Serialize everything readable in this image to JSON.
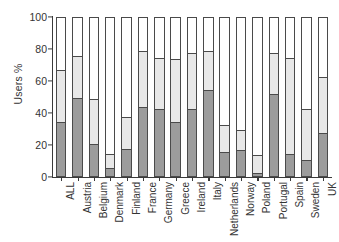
{
  "chart_data": {
    "type": "bar",
    "subtype": "stacked-bar",
    "title": "",
    "xlabel": "",
    "ylabel": "Users %",
    "ylim": [
      0,
      100
    ],
    "yticks": [
      0,
      20,
      40,
      60,
      80,
      100
    ],
    "ytick_labels": [
      "0",
      "20",
      "40",
      "60",
      "80",
      "100"
    ],
    "grid": false,
    "legend": "none",
    "stacked_total": 100,
    "categories": [
      "ALL",
      "Austria",
      "Belgium",
      "Denmark",
      "Finland",
      "France",
      "Germany",
      "Greece",
      "Ireland",
      "Italy",
      "Netherlands",
      "Norway",
      "Poland",
      "Portugal",
      "Spain",
      "Sweden",
      "UK"
    ],
    "series": [
      {
        "name": "dark-gray-segment",
        "color": "#9c9c9c",
        "values": [
          34,
          49,
          20,
          5,
          17,
          43,
          42,
          34,
          42,
          54,
          15,
          16,
          2,
          51,
          14,
          10,
          27
        ]
      },
      {
        "name": "light-gray-segment",
        "color": "#e8e8e8",
        "values": [
          32,
          26,
          28,
          9,
          20,
          35,
          32,
          39,
          35,
          24,
          17,
          13,
          11,
          26,
          60,
          32,
          35
        ]
      },
      {
        "name": "white-segment",
        "color": "#ffffff",
        "values": [
          34,
          25,
          52,
          86,
          63,
          22,
          26,
          27,
          23,
          22,
          68,
          71,
          87,
          23,
          26,
          58,
          38
        ]
      }
    ],
    "cumulative_tops": {
      "dark": [
        34,
        49,
        20,
        5,
        17,
        43,
        42,
        34,
        42,
        54,
        15,
        16,
        2,
        51,
        14,
        10,
        27
      ],
      "light": [
        66,
        75,
        48,
        14,
        37,
        78,
        74,
        73,
        77,
        78,
        32,
        29,
        13,
        77,
        74,
        42,
        62
      ]
    }
  }
}
